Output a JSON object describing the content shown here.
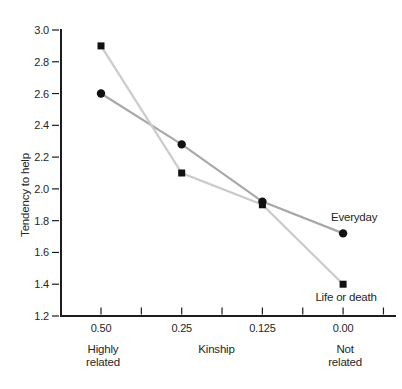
{
  "chart_data": {
    "type": "line",
    "title": "",
    "xlabel": "Kinship",
    "ylabel": "Tendency to help",
    "categories": [
      "0.50",
      "0.25",
      "0.125",
      "0.00"
    ],
    "x_end_labels": {
      "left": [
        "Highly",
        "related"
      ],
      "right": [
        "Not",
        "related"
      ]
    },
    "series": [
      {
        "name": "Everyday",
        "values": [
          2.6,
          2.28,
          1.92,
          1.72
        ],
        "marker": "circle",
        "line_color": "#a8a8a8",
        "marker_color": "#111111",
        "label_placement": "above-end"
      },
      {
        "name": "Life or death",
        "values": [
          2.9,
          2.1,
          1.9,
          1.4
        ],
        "marker": "square",
        "line_color": "#cbcbcb",
        "marker_color": "#111111",
        "label_placement": "below-end"
      }
    ],
    "ylim": [
      1.2,
      3.0
    ],
    "ytick_step": 0.2,
    "grid": false,
    "legend_position": "inline-end-labels",
    "axis_color": "#1c1c1c",
    "text_color": "#262626"
  }
}
